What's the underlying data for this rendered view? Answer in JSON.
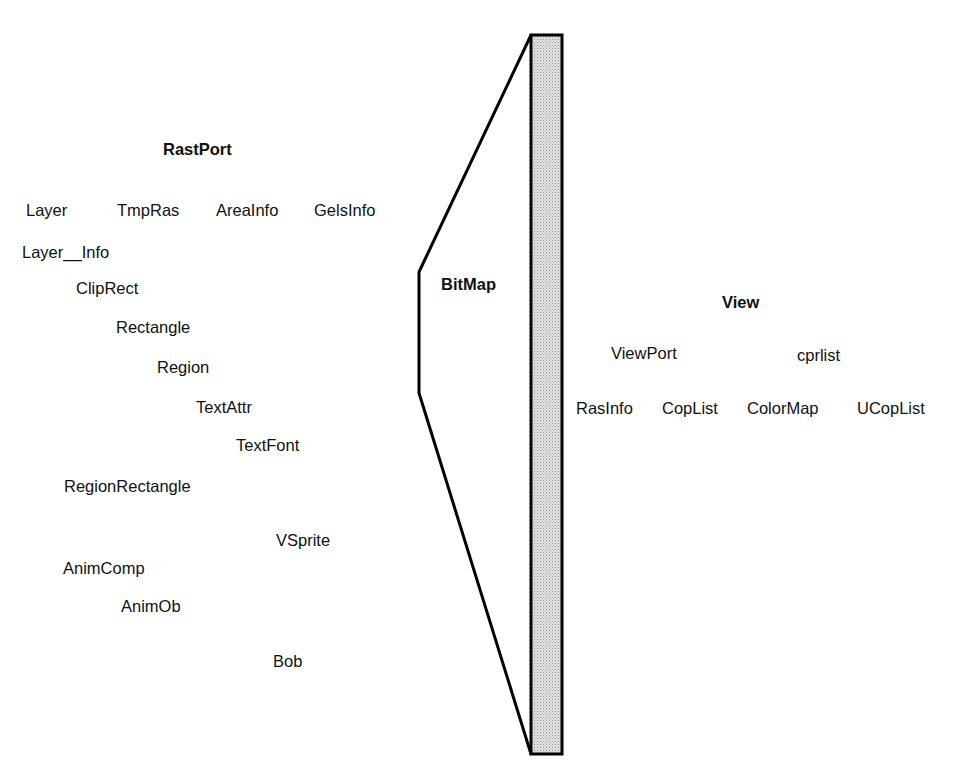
{
  "diagram": {
    "type": "graphics-structure-relationships",
    "bitmap": {
      "label": "BitMap",
      "bar_fill": "#c8c8c8",
      "stroke": "#000000"
    },
    "rastport_group": {
      "title": "RastPort",
      "items": [
        {
          "label": "Layer",
          "x": 26,
          "y": 200
        },
        {
          "label": "TmpRas",
          "x": 117,
          "y": 200
        },
        {
          "label": "AreaInfo",
          "x": 216,
          "y": 200
        },
        {
          "label": "GelsInfo",
          "x": 314,
          "y": 200
        },
        {
          "label": "Layer__Info",
          "x": 22,
          "y": 242
        },
        {
          "label": "ClipRect",
          "x": 76,
          "y": 278
        },
        {
          "label": "Rectangle",
          "x": 116,
          "y": 317
        },
        {
          "label": "Region",
          "x": 157,
          "y": 357
        },
        {
          "label": "TextAttr",
          "x": 196,
          "y": 397
        },
        {
          "label": "TextFont",
          "x": 236,
          "y": 435
        },
        {
          "label": "RegionRectangle",
          "x": 64,
          "y": 476
        },
        {
          "label": "VSprite",
          "x": 276,
          "y": 530
        },
        {
          "label": "AnimComp",
          "x": 63,
          "y": 558
        },
        {
          "label": "AnimOb",
          "x": 121,
          "y": 596
        },
        {
          "label": "Bob",
          "x": 273,
          "y": 651
        }
      ]
    },
    "view_group": {
      "title": "View",
      "items": [
        {
          "label": "ViewPort",
          "x": 611,
          "y": 343
        },
        {
          "label": "cprlist",
          "x": 797,
          "y": 345
        },
        {
          "label": "RasInfo",
          "x": 576,
          "y": 398
        },
        {
          "label": "CopList",
          "x": 662,
          "y": 398
        },
        {
          "label": "ColorMap",
          "x": 747,
          "y": 398
        },
        {
          "label": "UCopList",
          "x": 857,
          "y": 398
        }
      ]
    }
  }
}
